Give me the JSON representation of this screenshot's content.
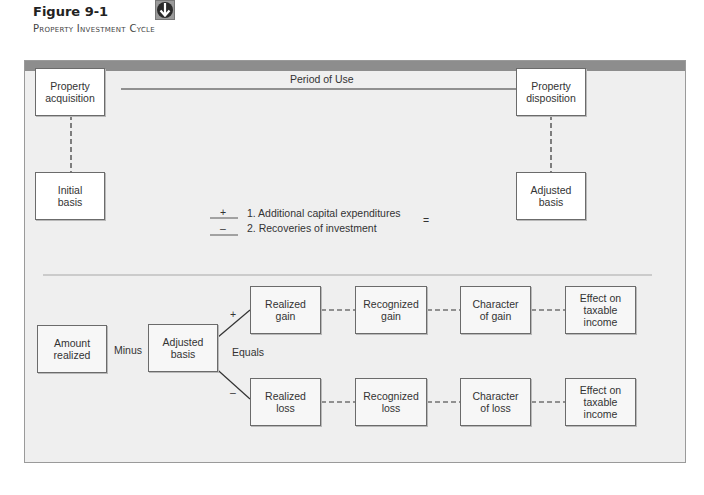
{
  "caption": {
    "figure_number": "Figure 9-1",
    "title": "Property Investment Cycle",
    "icon": "down-arrow-badge-icon"
  },
  "top_section": {
    "acquisition_box": {
      "line1": "Property",
      "line2": "acquisition"
    },
    "disposition_box": {
      "line1": "Property",
      "line2": "disposition"
    },
    "period_label": "Period of Use",
    "initial_basis_box": {
      "line1": "Initial",
      "line2": "basis"
    },
    "adjusted_basis_box": {
      "line1": "Adjusted",
      "line2": "basis"
    },
    "adjustments": [
      {
        "sign": "+",
        "text": "1. Additional capital expenditures"
      },
      {
        "sign": "–",
        "text": "2. Recoveries of investment"
      }
    ],
    "equals_sign": "="
  },
  "bottom_section": {
    "amount_realized_box": {
      "line1": "Amount",
      "line2": "realized"
    },
    "minus_label": "Minus",
    "adjusted_basis_box": {
      "line1": "Adjusted",
      "line2": "basis"
    },
    "equals_label": "Equals",
    "plus_sign": "+",
    "minus_sign": "–",
    "gain_row": [
      {
        "line1": "Realized",
        "line2": "gain"
      },
      {
        "line1": "Recognized",
        "line2": "gain"
      },
      {
        "line1": "Character",
        "line2": "of gain"
      },
      {
        "line1": "Effect on",
        "line2": "taxable",
        "line3": "income"
      }
    ],
    "loss_row": [
      {
        "line1": "Realized",
        "line2": "loss"
      },
      {
        "line1": "Recognized",
        "line2": "loss"
      },
      {
        "line1": "Character",
        "line2": "of loss"
      },
      {
        "line1": "Effect on",
        "line2": "taxable",
        "line3": "income"
      }
    ]
  },
  "colors": {
    "frame_background": "#efefef",
    "frame_header": "#8d8d8d",
    "box_border": "#6b6b6b",
    "line": "#333333"
  }
}
